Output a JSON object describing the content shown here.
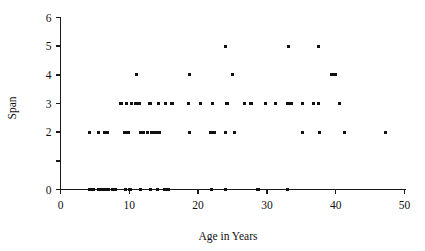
{
  "chart_data": {
    "type": "scatter",
    "title": "",
    "xlabel": "Age in Years",
    "ylabel": "Span",
    "xlim": [
      0,
      50
    ],
    "ylim": [
      0,
      6
    ],
    "xticks": [
      0,
      10,
      20,
      30,
      40,
      50
    ],
    "xtick_labels": [
      "0",
      "10",
      "20",
      "30",
      "40",
      "50"
    ],
    "yticks": [
      0,
      1,
      2,
      3,
      4,
      5,
      6
    ],
    "ytick_labels": [
      "0",
      "",
      "2",
      "3",
      "4",
      "5",
      "6"
    ],
    "grid": false,
    "legend": null,
    "marker": "square",
    "marker_color": "#111111",
    "points": [
      {
        "x": 4.2,
        "y": 2
      },
      {
        "x": 5.5,
        "y": 2
      },
      {
        "x": 6.4,
        "y": 2
      },
      {
        "x": 6.8,
        "y": 2
      },
      {
        "x": 9.3,
        "y": 2
      },
      {
        "x": 9.8,
        "y": 2
      },
      {
        "x": 11.6,
        "y": 2
      },
      {
        "x": 12.1,
        "y": 2
      },
      {
        "x": 12.6,
        "y": 2
      },
      {
        "x": 13.2,
        "y": 2
      },
      {
        "x": 13.6,
        "y": 2
      },
      {
        "x": 14.0,
        "y": 2
      },
      {
        "x": 14.4,
        "y": 2
      },
      {
        "x": 18.7,
        "y": 2
      },
      {
        "x": 21.8,
        "y": 2
      },
      {
        "x": 22.3,
        "y": 2
      },
      {
        "x": 24.0,
        "y": 2
      },
      {
        "x": 25.3,
        "y": 2
      },
      {
        "x": 35.2,
        "y": 2
      },
      {
        "x": 37.6,
        "y": 2
      },
      {
        "x": 41.3,
        "y": 2
      },
      {
        "x": 47.2,
        "y": 2
      },
      {
        "x": 8.8,
        "y": 3
      },
      {
        "x": 9.6,
        "y": 3
      },
      {
        "x": 10.3,
        "y": 3
      },
      {
        "x": 10.9,
        "y": 3
      },
      {
        "x": 11.4,
        "y": 3
      },
      {
        "x": 13.0,
        "y": 3
      },
      {
        "x": 14.2,
        "y": 3
      },
      {
        "x": 15.3,
        "y": 3
      },
      {
        "x": 16.2,
        "y": 3
      },
      {
        "x": 18.6,
        "y": 3
      },
      {
        "x": 20.4,
        "y": 3
      },
      {
        "x": 22.1,
        "y": 3
      },
      {
        "x": 24.2,
        "y": 3
      },
      {
        "x": 26.8,
        "y": 3
      },
      {
        "x": 27.7,
        "y": 3
      },
      {
        "x": 29.8,
        "y": 3
      },
      {
        "x": 31.2,
        "y": 3
      },
      {
        "x": 33.0,
        "y": 3
      },
      {
        "x": 33.5,
        "y": 3
      },
      {
        "x": 35.2,
        "y": 3
      },
      {
        "x": 36.8,
        "y": 3
      },
      {
        "x": 37.5,
        "y": 3
      },
      {
        "x": 40.5,
        "y": 3
      },
      {
        "x": 11.0,
        "y": 4
      },
      {
        "x": 18.7,
        "y": 4
      },
      {
        "x": 25.0,
        "y": 4
      },
      {
        "x": 39.4,
        "y": 4
      },
      {
        "x": 39.9,
        "y": 4
      },
      {
        "x": 24.0,
        "y": 5
      },
      {
        "x": 33.1,
        "y": 5
      },
      {
        "x": 37.5,
        "y": 5
      },
      {
        "x": 4.3,
        "y": 0
      },
      {
        "x": 4.8,
        "y": 0
      },
      {
        "x": 5.6,
        "y": 0
      },
      {
        "x": 6.1,
        "y": 0
      },
      {
        "x": 6.6,
        "y": 0
      },
      {
        "x": 7.0,
        "y": 0
      },
      {
        "x": 7.5,
        "y": 0
      },
      {
        "x": 8.0,
        "y": 0
      },
      {
        "x": 9.5,
        "y": 0
      },
      {
        "x": 10.1,
        "y": 0
      },
      {
        "x": 11.6,
        "y": 0
      },
      {
        "x": 13.1,
        "y": 0
      },
      {
        "x": 14.1,
        "y": 0
      },
      {
        "x": 15.2,
        "y": 0
      },
      {
        "x": 15.7,
        "y": 0
      },
      {
        "x": 22.0,
        "y": 0
      },
      {
        "x": 24.0,
        "y": 0
      },
      {
        "x": 28.7,
        "y": 0
      },
      {
        "x": 33.0,
        "y": 0
      }
    ]
  }
}
